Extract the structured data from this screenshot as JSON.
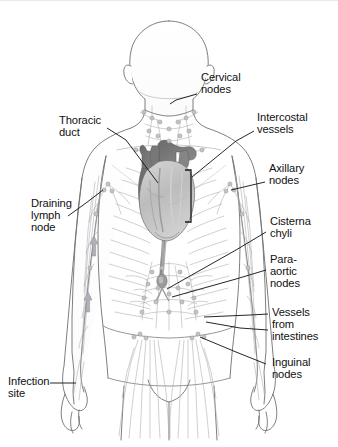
{
  "figure": {
    "type": "anatomical-illustration",
    "background_color": "#ffffff",
    "line_color": "#6f6f6f",
    "text_color": "#111111",
    "leader_color": "#1a1a1a"
  },
  "labels": {
    "cervical_nodes": "Cervical\nnodes",
    "thoracic_duct": "Thoracic\nduct",
    "intercostal_vessels": "Intercostal\nvessels",
    "axillary_nodes": "Axillary\nnodes",
    "draining_lymph_node": "Draining\nlymph\nnode",
    "cisterna_chyli": "Cisterna\nchyli",
    "para_aortic_nodes": "Para-\naortic\nnodes",
    "vessels_from_intestines": "Vessels\nfrom\nintestines",
    "inguinal_nodes": "Inguinal\nnodes",
    "infection_site": "Infection\nsite"
  },
  "structures": {
    "heart": {
      "name": "heart",
      "fill_dark": "#7b7b7b",
      "fill_light": "#c9c9c9"
    },
    "bracket": {
      "name": "intercostal-bracket"
    },
    "flow_arrows": {
      "name": "lymph-flow-arrows",
      "count": 2,
      "direction": "upward"
    }
  }
}
